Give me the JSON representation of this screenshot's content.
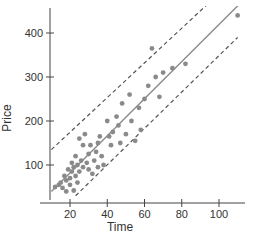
{
  "chart_data": {
    "type": "scatter",
    "title": "",
    "xlabel": "Time",
    "ylabel": "Price",
    "xlim": [
      10,
      115
    ],
    "ylim": [
      30,
      460
    ],
    "xticks": [
      20,
      40,
      60,
      80,
      100
    ],
    "yticks": [
      100,
      200,
      300,
      400
    ],
    "grid": false,
    "legend": null,
    "colors": {
      "points": "#8a8a8a",
      "line": "#8a8a8a",
      "band": "#555555",
      "axis": "#444444"
    },
    "points": [
      {
        "x": 12,
        "y": 50
      },
      {
        "x": 14,
        "y": 55
      },
      {
        "x": 15,
        "y": 60
      },
      {
        "x": 16,
        "y": 48
      },
      {
        "x": 17,
        "y": 75
      },
      {
        "x": 18,
        "y": 65
      },
      {
        "x": 18,
        "y": 40
      },
      {
        "x": 19,
        "y": 90
      },
      {
        "x": 20,
        "y": 70
      },
      {
        "x": 20,
        "y": 55
      },
      {
        "x": 21,
        "y": 85
      },
      {
        "x": 21,
        "y": 105
      },
      {
        "x": 22,
        "y": 95
      },
      {
        "x": 22,
        "y": 42
      },
      {
        "x": 23,
        "y": 75
      },
      {
        "x": 23,
        "y": 120
      },
      {
        "x": 24,
        "y": 60
      },
      {
        "x": 24,
        "y": 100
      },
      {
        "x": 25,
        "y": 160
      },
      {
        "x": 25,
        "y": 85
      },
      {
        "x": 26,
        "y": 110
      },
      {
        "x": 27,
        "y": 95
      },
      {
        "x": 27,
        "y": 145
      },
      {
        "x": 28,
        "y": 170
      },
      {
        "x": 29,
        "y": 105
      },
      {
        "x": 30,
        "y": 90
      },
      {
        "x": 30,
        "y": 125
      },
      {
        "x": 31,
        "y": 145
      },
      {
        "x": 32,
        "y": 80
      },
      {
        "x": 33,
        "y": 110
      },
      {
        "x": 34,
        "y": 130
      },
      {
        "x": 35,
        "y": 150
      },
      {
        "x": 35,
        "y": 95
      },
      {
        "x": 36,
        "y": 165
      },
      {
        "x": 37,
        "y": 120
      },
      {
        "x": 38,
        "y": 100
      },
      {
        "x": 40,
        "y": 200
      },
      {
        "x": 41,
        "y": 165
      },
      {
        "x": 42,
        "y": 145
      },
      {
        "x": 43,
        "y": 175
      },
      {
        "x": 45,
        "y": 210
      },
      {
        "x": 46,
        "y": 190
      },
      {
        "x": 47,
        "y": 150
      },
      {
        "x": 48,
        "y": 240
      },
      {
        "x": 50,
        "y": 170
      },
      {
        "x": 52,
        "y": 260
      },
      {
        "x": 53,
        "y": 200
      },
      {
        "x": 55,
        "y": 155
      },
      {
        "x": 57,
        "y": 230
      },
      {
        "x": 58,
        "y": 180
      },
      {
        "x": 60,
        "y": 250
      },
      {
        "x": 62,
        "y": 280
      },
      {
        "x": 64,
        "y": 365
      },
      {
        "x": 66,
        "y": 300
      },
      {
        "x": 68,
        "y": 255
      },
      {
        "x": 70,
        "y": 310
      },
      {
        "x": 75,
        "y": 320
      },
      {
        "x": 82,
        "y": 330
      },
      {
        "x": 110,
        "y": 440
      }
    ],
    "regression_line": {
      "x": [
        10,
        112
      ],
      "y": [
        40,
        470
      ],
      "style": "solid"
    },
    "prediction_band_upper": {
      "x": [
        10,
        95
      ],
      "y": [
        135,
        470
      ],
      "style": "dashed"
    },
    "prediction_band_lower": {
      "x": [
        23,
        110
      ],
      "y": [
        30,
        390
      ],
      "style": "dashed"
    }
  }
}
